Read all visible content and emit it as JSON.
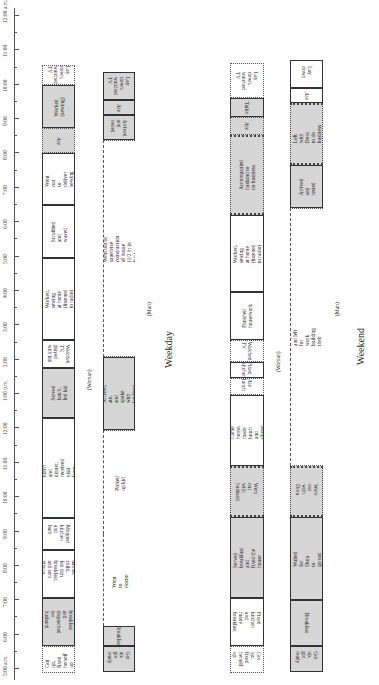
{
  "axis": {
    "ticks": [
      "5:00 a.m.",
      "6:00",
      "7:00",
      "8:00",
      "9:00",
      "10:00",
      "11:00",
      "12:00",
      "1:00 p.m.",
      "2:00",
      "3:00",
      "4:00",
      "5:00",
      "6:00",
      "7:00",
      "8:00",
      "9:00",
      "10:00",
      "11:00",
      "12:00 a.m."
    ]
  },
  "weekday": {
    "title": "Weekday",
    "woman_label": "(Woman)",
    "man_label": "(Man)",
    "woman": [
      "Got up, fixed\nherself up",
      "Fixed breakfast\nand dispatched\nher husband\nand kids",
      "Cleaned kitchen,\nbathed child,\nfed him breakfast,\nand sent him to\nkindergarten\nwith sister",
      "Mopped kitchen\nand bath",
      "Made lunch and dinner,\nreceived visit from\nlandlord",
      "Served\nlunch,\nfed kid",
      "Watched TV,\nplayed with kid",
      "Worked, sewing at home\n(listened to radio)",
      "Scrubbed\nand waxed",
      "Went out\nto deliver\nsewing",
      "Ate",
      "Worked\n(sewing)",
      "Lay down,\nwatched TV"
    ],
    "man": [
      "Got up,\ngot ready",
      "Breakfast",
      "Went to doctor",
      "Picked up kid",
      "Arrived, ate,\nand spoke\nwith landlord",
      "Went out to supervise construction of house\n(1/2 hr in bus)",
      "Arrived\nand rested",
      "Ate",
      "Lay down,\nwatched TV"
    ]
  },
  "weekend": {
    "title": "Weekend",
    "woman_label": "(Woman)",
    "man_label": "(Man)",
    "woman": [
      "Got up, fixed\nherself up",
      "Fixed kitchen\nand made\nbreakfast",
      "Served breakfast and\nfixed the house",
      "Went out\nwith husband",
      "Came home,\nmade lunch and\ndinner",
      "Ate lunch",
      "Fixed kitchen",
      "Watched TV",
      "Finished\nhousework",
      "Worked, sewing\nat home\n(listened to radio)",
      "Accompanied\nhusband to\ndo business",
      "Ate",
      "Tailor",
      "Lay down,\nwatched TV"
    ],
    "man": [
      "Got up,\ngot ready",
      "Breakfast",
      "Waited for\nDora to\ngo out",
      "Went out\nwith Dora",
      "Arrived and left for work building their house",
      "Arrived\nand\nrested",
      "Left with Dora\nto do business",
      "Ate",
      "Lay down"
    ]
  }
}
